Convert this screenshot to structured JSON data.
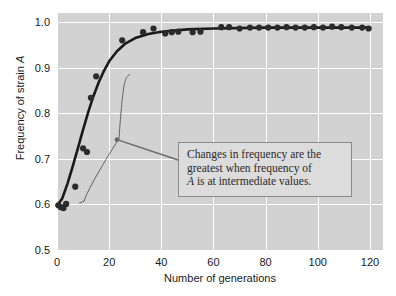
{
  "chart_data": {
    "type": "scatter",
    "title": "",
    "xlabel": "Number of generations",
    "ylabel": "Frequency of strain A",
    "ylabel_plain": "Frequency of strain ",
    "ylabel_italic": "A",
    "xlim": [
      0,
      125
    ],
    "ylim": [
      0.5,
      1.02
    ],
    "xticks": [
      0,
      20,
      40,
      60,
      80,
      100,
      120
    ],
    "xticklabels": [
      "0",
      "20",
      "40",
      "60",
      "80",
      "100",
      "120"
    ],
    "yticks": [
      0.5,
      0.6,
      0.7,
      0.8,
      0.9,
      1.0
    ],
    "yticklabels": [
      "0.5",
      "0.6",
      "0.7",
      "0.8",
      "0.9",
      "1.0"
    ],
    "grid": true,
    "grid_color": "#ffffff",
    "plot_background": "#d2d2d2",
    "marker_color": "#2b2b2b",
    "curve_color": "#1a1a1a",
    "legend": "none",
    "series": [
      {
        "name": "Frequency of strain A",
        "marker": "circle",
        "points": [
          {
            "x": 0.5,
            "y": 0.598
          },
          {
            "x": 1.5,
            "y": 0.594
          },
          {
            "x": 2.5,
            "y": 0.592
          },
          {
            "x": 3.5,
            "y": 0.601
          },
          {
            "x": 7.0,
            "y": 0.639
          },
          {
            "x": 10.0,
            "y": 0.723
          },
          {
            "x": 11.5,
            "y": 0.715
          },
          {
            "x": 13.0,
            "y": 0.834
          },
          {
            "x": 15.0,
            "y": 0.881
          },
          {
            "x": 25.0,
            "y": 0.96
          },
          {
            "x": 33.0,
            "y": 0.978
          },
          {
            "x": 37.0,
            "y": 0.986
          },
          {
            "x": 41.5,
            "y": 0.975
          },
          {
            "x": 44.0,
            "y": 0.978
          },
          {
            "x": 46.5,
            "y": 0.979
          },
          {
            "x": 52.0,
            "y": 0.978
          },
          {
            "x": 55.0,
            "y": 0.979
          },
          {
            "x": 63.0,
            "y": 0.989
          },
          {
            "x": 66.0,
            "y": 0.989
          },
          {
            "x": 70.0,
            "y": 0.986
          },
          {
            "x": 74.0,
            "y": 0.988
          },
          {
            "x": 77.5,
            "y": 0.988
          },
          {
            "x": 81.0,
            "y": 0.988
          },
          {
            "x": 84.5,
            "y": 0.988
          },
          {
            "x": 88.0,
            "y": 0.989
          },
          {
            "x": 91.5,
            "y": 0.988
          },
          {
            "x": 95.0,
            "y": 0.988
          },
          {
            "x": 98.5,
            "y": 0.989
          },
          {
            "x": 102.0,
            "y": 0.988
          },
          {
            "x": 105.5,
            "y": 0.99
          },
          {
            "x": 109.0,
            "y": 0.989
          },
          {
            "x": 113.0,
            "y": 0.988
          },
          {
            "x": 117.0,
            "y": 0.988
          },
          {
            "x": 119.5,
            "y": 0.986
          }
        ]
      }
    ],
    "fit_curve": {
      "name": "logistic fit",
      "points": [
        {
          "x": 0.0,
          "y": 0.597
        },
        {
          "x": 2.0,
          "y": 0.613
        },
        {
          "x": 4.0,
          "y": 0.645
        },
        {
          "x": 6.0,
          "y": 0.683
        },
        {
          "x": 8.0,
          "y": 0.723
        },
        {
          "x": 10.0,
          "y": 0.764
        },
        {
          "x": 12.0,
          "y": 0.803
        },
        {
          "x": 14.0,
          "y": 0.838
        },
        {
          "x": 16.0,
          "y": 0.868
        },
        {
          "x": 18.0,
          "y": 0.893
        },
        {
          "x": 20.0,
          "y": 0.914
        },
        {
          "x": 23.0,
          "y": 0.936
        },
        {
          "x": 26.0,
          "y": 0.952
        },
        {
          "x": 30.0,
          "y": 0.965
        },
        {
          "x": 35.0,
          "y": 0.974
        },
        {
          "x": 40.0,
          "y": 0.979
        },
        {
          "x": 50.0,
          "y": 0.984
        },
        {
          "x": 60.0,
          "y": 0.986
        },
        {
          "x": 80.0,
          "y": 0.988
        },
        {
          "x": 100.0,
          "y": 0.988
        },
        {
          "x": 120.0,
          "y": 0.988
        }
      ]
    },
    "annotations": [
      {
        "name": "callout",
        "lines": [
          "Changes in frequency are the",
          "greatest when frequency of",
          "A is at intermediate values."
        ],
        "line3_italic_prefix": "A",
        "line3_rest": " is at intermediate values.",
        "box_fill": "#dcdcdc",
        "box_border": "#8a8a8a",
        "leader_target_x": 23.0,
        "leader_target_y": 0.742
      }
    ],
    "brace": {
      "name": "range-brace",
      "description": "thin bracket marking the steep-rise region of the curve",
      "color": "#555555"
    }
  }
}
